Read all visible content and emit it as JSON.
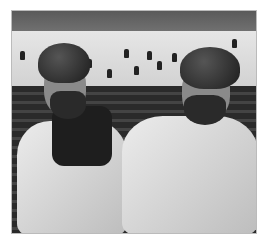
{
  "image": {
    "description": "Black-and-white photo of two men in turbans sitting in arena seats in front of an ice rink with skaters",
    "palette": {
      "ice": "#e0e0e0",
      "seats": "#2e2e2e",
      "shirt": "#dcdcdc",
      "turban": "#262626"
    }
  }
}
